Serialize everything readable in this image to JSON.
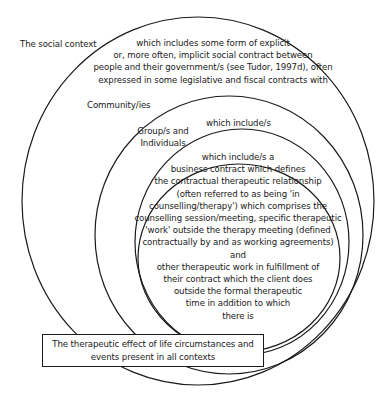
{
  "diagram": {
    "type": "nested-circles",
    "layers": [
      {
        "name": "The social context",
        "description_lines": [
          "which includes some form of explicit",
          "or, more often, implicit social contract between",
          "people and their government/s (see Tudor, 1997d), often",
          "expressed in some legislative and fiscal contracts with"
        ]
      },
      {
        "name": "Community/ies",
        "description_lines": []
      },
      {
        "name_lines": [
          "Group/s and",
          "Individuals"
        ],
        "description_lines": [
          "which include/s"
        ]
      },
      {
        "description_lines": [
          "which include/s a",
          "business contract which defines",
          "the contractual therapeutic relationship",
          "(often referred to as being 'in",
          "counselling/therapy') which comprises the",
          "counselling session/meeting, specific therapeutic",
          "'work' outside the therapy meeting (defined",
          "contractually by and as working agreements)",
          "and",
          "other therapeutic work in fulfillment of",
          "their contract which the client does",
          "outside the formal therapeutic",
          "time in addition to which",
          "there is"
        ]
      }
    ],
    "box": {
      "lines": [
        "The therapeutic effect of life circumstances and",
        "events present in all contexts"
      ]
    },
    "colors": {
      "stroke": "#1a1a1a",
      "background": "#ffffff"
    }
  }
}
